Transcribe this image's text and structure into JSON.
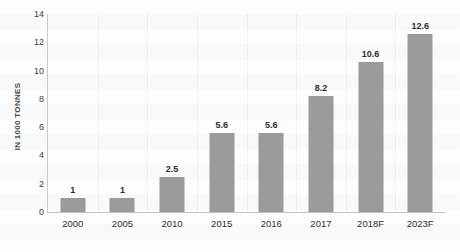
{
  "chart_data": {
    "type": "bar",
    "title": "",
    "xlabel": "",
    "ylabel": "IN 1000 TONNES",
    "categories": [
      "2000",
      "2005",
      "2010",
      "2015",
      "2016",
      "2017",
      "2018F",
      "2023F"
    ],
    "values": [
      1,
      1,
      2.5,
      5.6,
      5.6,
      8.2,
      10.6,
      12.6
    ],
    "value_labels": [
      "1",
      "1",
      "2.5",
      "5.6",
      "5.6",
      "8.2",
      "10.6",
      "12.6"
    ],
    "ylim": [
      0,
      14
    ],
    "yticks": [
      0,
      2,
      4,
      6,
      8,
      10,
      12,
      14
    ],
    "ytick_labels": [
      "0",
      "2",
      "4",
      "6",
      "8",
      "10",
      "12",
      "14"
    ],
    "grid": "faint-vertical",
    "legend": "none",
    "bar_color": "#9a9a9a",
    "background_color": "#fdfdfd",
    "axis_color": "#c2c2c2",
    "text_color": "#2e2e2e"
  }
}
